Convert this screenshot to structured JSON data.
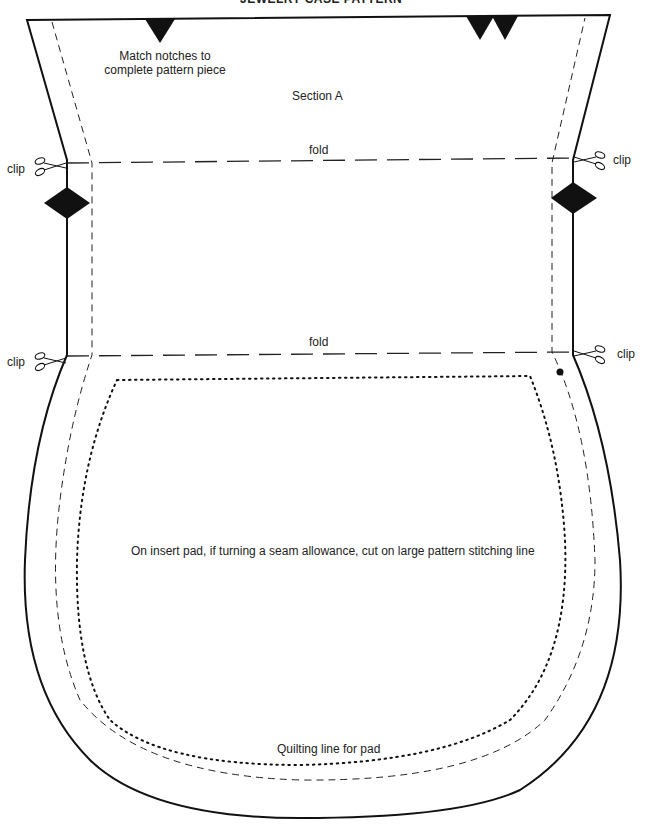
{
  "header": {
    "title": "JEWELRY CASE PATTERN"
  },
  "labels": {
    "match_notches": [
      "Match notches to",
      "complete pattern piece"
    ],
    "section": "Section A",
    "fold_top": "fold",
    "fold_bottom": "fold",
    "clip_top_left": "clip",
    "clip_top_right": "clip",
    "clip_bottom_left": "clip",
    "clip_bottom_right": "clip",
    "insert_pad_note": "On insert pad, if turning a seam allowance, cut on large pattern stitching line",
    "quilting_line": "Quilting line for pad"
  },
  "legend_lines": {
    "cutting_line": "solid",
    "stitching_line": "dashed",
    "fold_line": "long-dashed",
    "quilting_line": "dotted"
  },
  "markers": {
    "top_notches": 3,
    "side_diamonds": 2,
    "clip_marks": 4,
    "dot_marker": 1
  },
  "colors": {
    "line": "#111111",
    "background": "#ffffff"
  }
}
